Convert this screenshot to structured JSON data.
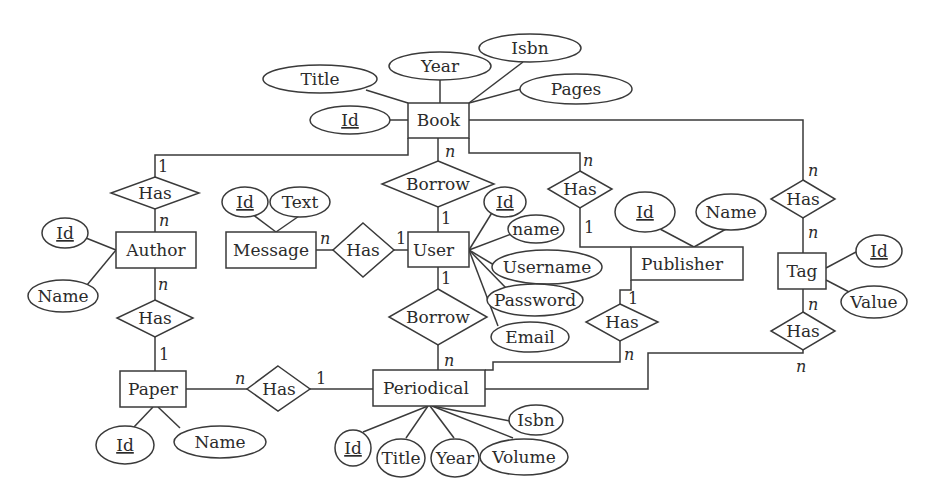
{
  "diagram": {
    "type": "entity-relationship",
    "colors": {
      "stroke": "#3a3a3a",
      "text": "#2b2b2b",
      "background": "#ffffff"
    },
    "entities": [
      {
        "id": "book",
        "label": "Book",
        "attributes": [
          {
            "label": "Id",
            "key": true
          },
          {
            "label": "Title"
          },
          {
            "label": "Year"
          },
          {
            "label": "Isbn"
          },
          {
            "label": "Pages"
          }
        ]
      },
      {
        "id": "user",
        "label": "User",
        "attributes": [
          {
            "label": "Id",
            "key": true
          },
          {
            "label": "name"
          },
          {
            "label": "Username"
          },
          {
            "label": "Password"
          },
          {
            "label": "Email"
          }
        ]
      },
      {
        "id": "author",
        "label": "Author",
        "attributes": [
          {
            "label": "Id",
            "key": true
          },
          {
            "label": "Name"
          }
        ]
      },
      {
        "id": "message",
        "label": "Message",
        "attributes": [
          {
            "label": "Id",
            "key": true
          },
          {
            "label": "Text"
          }
        ]
      },
      {
        "id": "publisher",
        "label": "Publisher",
        "attributes": [
          {
            "label": "Id",
            "key": true
          },
          {
            "label": "Name"
          }
        ]
      },
      {
        "id": "tag",
        "label": "Tag",
        "attributes": [
          {
            "label": "Id",
            "key": true
          },
          {
            "label": "Value"
          }
        ]
      },
      {
        "id": "paper",
        "label": "Paper",
        "attributes": [
          {
            "label": "Id",
            "key": true
          },
          {
            "label": "Name"
          }
        ]
      },
      {
        "id": "periodical",
        "label": "Periodical",
        "attributes": [
          {
            "label": "Id",
            "key": true
          },
          {
            "label": "Title"
          },
          {
            "label": "Year"
          },
          {
            "label": "Volume"
          },
          {
            "label": "Isbn"
          }
        ]
      }
    ],
    "relationships": [
      {
        "id": "book-author-has",
        "label": "Has",
        "from": "Book",
        "from_card": "1",
        "to": "Author",
        "to_card": "n"
      },
      {
        "id": "book-user-borrow",
        "label": "Borrow",
        "from": "Book",
        "from_card": "n",
        "to": "User",
        "to_card": "1"
      },
      {
        "id": "book-publisher-has",
        "label": "Has",
        "from": "Book",
        "from_card": "n",
        "to": "Publisher",
        "to_card": "1"
      },
      {
        "id": "book-tag-has",
        "label": "Has",
        "from": "Book",
        "from_card": "n",
        "to": "Tag",
        "to_card": "n"
      },
      {
        "id": "message-user-has",
        "label": "Has",
        "from": "Message",
        "from_card": "n",
        "to": "User",
        "to_card": "1"
      },
      {
        "id": "user-periodical-borrow",
        "label": "Borrow",
        "from": "User",
        "from_card": "1",
        "to": "Periodical",
        "to_card": "n"
      },
      {
        "id": "author-paper-has",
        "label": "Has",
        "from": "Author",
        "from_card": "n",
        "to": "Paper",
        "to_card": "1"
      },
      {
        "id": "paper-periodical-has",
        "label": "Has",
        "from": "Paper",
        "from_card": "n",
        "to": "Periodical",
        "to_card": "1"
      },
      {
        "id": "publisher-periodical-has",
        "label": "Has",
        "from": "Publisher",
        "from_card": "1",
        "to": "Periodical",
        "to_card": "n"
      },
      {
        "id": "tag-periodical-has",
        "label": "Has",
        "from": "Tag",
        "from_card": "n",
        "to": "Periodical",
        "to_card": "n"
      }
    ]
  },
  "labels": {
    "book": "Book",
    "book_id": "Id",
    "book_title": "Title",
    "book_year": "Year",
    "book_isbn": "Isbn",
    "book_pages": "Pages",
    "user": "User",
    "user_id": "Id",
    "user_name": "name",
    "user_username": "Username",
    "user_password": "Password",
    "user_email": "Email",
    "author": "Author",
    "author_id": "Id",
    "author_name": "Name",
    "message": "Message",
    "message_id": "Id",
    "message_text": "Text",
    "publisher": "Publisher",
    "publisher_id": "Id",
    "publisher_name": "Name",
    "tag": "Tag",
    "tag_id": "Id",
    "tag_value": "Value",
    "paper": "Paper",
    "paper_id": "Id",
    "paper_name": "Name",
    "periodical": "Periodical",
    "periodical_id": "Id",
    "periodical_title": "Title",
    "periodical_year": "Year",
    "periodical_volume": "Volume",
    "periodical_isbn": "Isbn",
    "rel_has": "Has",
    "rel_borrow": "Borrow"
  },
  "cardinalities": {
    "book_author_book": "1",
    "book_author_author": "n",
    "book_borrow_book": "n",
    "book_borrow_user": "1",
    "book_pub_book": "n",
    "book_pub_pub": "1",
    "book_tag_book": "n",
    "book_tag_tag": "n",
    "msg_user_msg": "n",
    "msg_user_user": "1",
    "user_per_user": "1",
    "user_per_per": "n",
    "author_paper_author": "n",
    "author_paper_paper": "1",
    "paper_per_paper": "n",
    "paper_per_per": "1",
    "pub_per_pub": "1",
    "pub_per_per": "n",
    "tag_per_tag": "n",
    "tag_per_per": "n"
  }
}
